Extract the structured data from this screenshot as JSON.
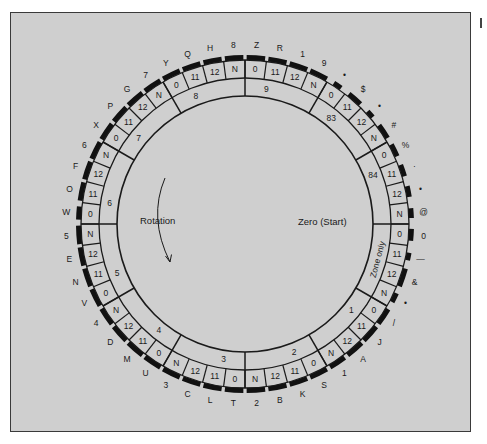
{
  "diagram": {
    "center_labels": {
      "rotation": "Rotation",
      "zero_start": "Zero (Start)"
    },
    "geometry": {
      "cx": 245,
      "cy": 224,
      "r_inner": 128,
      "r_zone_outer": 146,
      "r_cell_outer": 164,
      "r_bar_outer": 169,
      "r_label": 179,
      "cell_degrees": 7.5
    },
    "colors": {
      "background": "#cfcfcf",
      "ink": "#1a1a1a",
      "bar": "#111111"
    },
    "zones": [
      {
        "label": "Zone only",
        "rotated": true,
        "cells": [
          {
            "code": "0",
            "outer": "0",
            "bar": 0.55
          },
          {
            "code": "11",
            "outer": "—",
            "bar": 0.35
          },
          {
            "code": "12",
            "outer": "&",
            "bar": 0.85
          },
          {
            "code": "N",
            "outer": "•",
            "bar": 0.45
          }
        ]
      },
      {
        "label": "1",
        "cells": [
          {
            "code": "0",
            "outer": "/",
            "bar": 0.8
          },
          {
            "code": "11",
            "outer": "J",
            "bar": 0.85
          },
          {
            "code": "12",
            "outer": "A",
            "bar": 0.85
          },
          {
            "code": "N",
            "outer": "1",
            "bar": 0.8
          }
        ]
      },
      {
        "label": "2",
        "cells": [
          {
            "code": "0",
            "outer": "S",
            "bar": 0.85
          },
          {
            "code": "11",
            "outer": "K",
            "bar": 0.85
          },
          {
            "code": "12",
            "outer": "B",
            "bar": 0.85
          },
          {
            "code": "N",
            "outer": "2",
            "bar": 0.85
          }
        ]
      },
      {
        "label": "3",
        "cells": [
          {
            "code": "0",
            "outer": "T",
            "bar": 0.85
          },
          {
            "code": "11",
            "outer": "L",
            "bar": 0.85
          },
          {
            "code": "12",
            "outer": "C",
            "bar": 0.85
          },
          {
            "code": "N",
            "outer": "3",
            "bar": 0.85
          }
        ]
      },
      {
        "label": "4",
        "cells": [
          {
            "code": "0",
            "outer": "U",
            "bar": 0.85
          },
          {
            "code": "11",
            "outer": "M",
            "bar": 0.85
          },
          {
            "code": "12",
            "outer": "D",
            "bar": 0.85
          },
          {
            "code": "N",
            "outer": "4",
            "bar": 0.85
          }
        ]
      },
      {
        "label": "5",
        "cells": [
          {
            "code": "0",
            "outer": "V",
            "bar": 0.85
          },
          {
            "code": "11",
            "outer": "N",
            "bar": 0.85
          },
          {
            "code": "12",
            "outer": "E",
            "bar": 0.85
          },
          {
            "code": "N",
            "outer": "5",
            "bar": 0.85
          }
        ]
      },
      {
        "label": "6",
        "cells": [
          {
            "code": "0",
            "outer": "W",
            "bar": 0.6
          },
          {
            "code": "11",
            "outer": "O",
            "bar": 0.85
          },
          {
            "code": "12",
            "outer": "F",
            "bar": 0.85
          },
          {
            "code": "N",
            "outer": "6",
            "bar": 0.85
          }
        ]
      },
      {
        "label": "7",
        "cells": [
          {
            "code": "0",
            "outer": "X",
            "bar": 0.85
          },
          {
            "code": "11",
            "outer": "P",
            "bar": 0.85
          },
          {
            "code": "12",
            "outer": "G",
            "bar": 0.85
          },
          {
            "code": "N",
            "outer": "7",
            "bar": 0.85
          }
        ]
      },
      {
        "label": "8",
        "cells": [
          {
            "code": "0",
            "outer": "Y",
            "bar": 0.85
          },
          {
            "code": "11",
            "outer": "Q",
            "bar": 0.85
          },
          {
            "code": "12",
            "outer": "H",
            "bar": 0.85
          },
          {
            "code": "N",
            "outer": "8",
            "bar": 0.85
          }
        ]
      },
      {
        "label": "9",
        "cells": [
          {
            "code": "0",
            "outer": "Z",
            "bar": 0.85
          },
          {
            "code": "11",
            "outer": "R",
            "bar": 0.85
          },
          {
            "code": "12",
            "outer": "1",
            "bar": 0.85
          },
          {
            "code": "N",
            "outer": "9",
            "bar": 0.85
          }
        ]
      },
      {
        "label": "83",
        "cells": [
          {
            "code": "0",
            "outer": "•",
            "bar": 0.4
          },
          {
            "code": "11",
            "outer": "$",
            "bar": 0.7
          },
          {
            "code": "12",
            "outer": "•",
            "bar": 0.35
          },
          {
            "code": "N",
            "outer": "#",
            "bar": 0.7
          }
        ]
      },
      {
        "label": "84",
        "cells": [
          {
            "code": "0",
            "outer": "%",
            "bar": 0.6
          },
          {
            "code": "11",
            "outer": "·",
            "bar": 0.55
          },
          {
            "code": "12",
            "outer": "•",
            "bar": 0.5
          },
          {
            "code": "N",
            "outer": "@",
            "bar": 0.45
          }
        ]
      }
    ]
  }
}
